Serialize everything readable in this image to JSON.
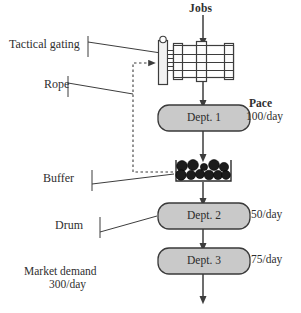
{
  "diagram": {
    "title_flow": "Drum-Buffer-Rope production flow",
    "labels": {
      "jobs": "Jobs",
      "tactical_gating": "Tactical gating",
      "rope": "Rope",
      "pace": "Pace",
      "pace_value": "100/day",
      "buffer": "Buffer",
      "drum": "Drum",
      "market_demand": "Market demand",
      "market_demand_value": "300/day"
    },
    "departments": [
      {
        "name": "Dept. 1",
        "rate": "100/day"
      },
      {
        "name": "Dept. 2",
        "rate": "50/day"
      },
      {
        "name": "Dept. 3",
        "rate": "75/day"
      }
    ],
    "rates": {
      "dept2": "50/day",
      "dept3": "75/day"
    },
    "buffer_items": 11,
    "icons": {
      "gate": "tactical-gate-icon",
      "buffer_queue": "buffer-queue-icon",
      "rope_link": "rope-dashed-link-icon"
    },
    "colors": {
      "box_fill": "#c9c9c9",
      "box_stroke": "#3a3a3a",
      "line": "#3d3d3d",
      "dot_fill": "#1c1c1c",
      "background": "#ffffff"
    }
  }
}
